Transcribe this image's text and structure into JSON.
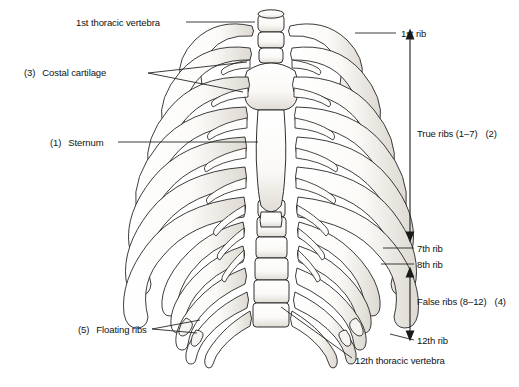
{
  "figure": {
    "background_color": "#ffffff",
    "line_color": "#1a1a1a",
    "bone_fill": "#fbfaf7",
    "shade_color": "#b9b6b0"
  },
  "labels": {
    "thoracic_vertebra_1": "1st thoracic vertebra",
    "costal_cartilage_num": "(3)",
    "costal_cartilage": "Costal cartilage",
    "sternum_num": "(1)",
    "sternum": "Sternum",
    "floating_ribs_num": "(5)",
    "floating_ribs": "Floating ribs",
    "rib_1": "1st rib",
    "true_ribs": "True ribs (1–7)",
    "true_ribs_num": "(2)",
    "rib_7": "7th rib",
    "rib_8": "8th rib",
    "false_ribs": "False ribs (8–12)",
    "false_ribs_num": "(4)",
    "rib_12": "12th rib",
    "thoracic_vertebra_12": "12th thoracic vertebra"
  },
  "brackets": {
    "true_ribs_span": {
      "top": 33,
      "bottom": 238,
      "x": 410
    },
    "false_ribs_span": {
      "top": 270,
      "bottom": 337,
      "x": 410
    }
  }
}
